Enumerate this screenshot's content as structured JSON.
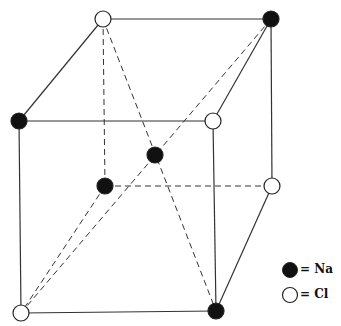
{
  "colors": {
    "line": "#333333",
    "na_fill": "#111111",
    "cl_fill": "#ffffff",
    "stroke": "#222222"
  },
  "legend": {
    "items": [
      {
        "symbol": "filled-circle",
        "label": "= Na",
        "element": "Na"
      },
      {
        "symbol": "open-circle",
        "label": "= Cl",
        "element": "Cl"
      }
    ]
  },
  "atoms": [
    {
      "id": "back-top-left",
      "x": 103,
      "y": 19,
      "element": "Cl"
    },
    {
      "id": "back-top-right",
      "x": 271,
      "y": 19,
      "element": "Na"
    },
    {
      "id": "front-top-left",
      "x": 19,
      "y": 121,
      "element": "Na"
    },
    {
      "id": "front-top-right",
      "x": 213,
      "y": 121,
      "element": "Cl"
    },
    {
      "id": "center",
      "x": 155,
      "y": 155,
      "element": "Na"
    },
    {
      "id": "back-bottom-left",
      "x": 105,
      "y": 186,
      "element": "Na"
    },
    {
      "id": "back-bottom-right",
      "x": 272,
      "y": 186,
      "element": "Cl"
    },
    {
      "id": "front-bottom-left",
      "x": 21,
      "y": 313,
      "element": "Cl"
    },
    {
      "id": "front-bottom-right",
      "x": 216,
      "y": 311,
      "element": "Na"
    }
  ],
  "edges_solid": [
    [
      "back-top-left",
      "back-top-right"
    ],
    [
      "back-top-left",
      "front-top-left"
    ],
    [
      "back-top-right",
      "front-top-right"
    ],
    [
      "back-top-right",
      "back-bottom-right"
    ],
    [
      "front-top-left",
      "front-top-right"
    ],
    [
      "front-top-left",
      "front-bottom-left"
    ],
    [
      "front-top-right",
      "front-bottom-right"
    ],
    [
      "front-bottom-left",
      "front-bottom-right"
    ],
    [
      "front-bottom-right",
      "back-bottom-right"
    ]
  ],
  "edges_dashed": [
    [
      "back-top-left",
      "back-bottom-left"
    ],
    [
      "back-bottom-left",
      "back-bottom-right"
    ],
    [
      "back-bottom-left",
      "front-bottom-left"
    ],
    [
      "back-top-left",
      "front-bottom-right"
    ],
    [
      "back-top-right",
      "front-bottom-left"
    ]
  ]
}
